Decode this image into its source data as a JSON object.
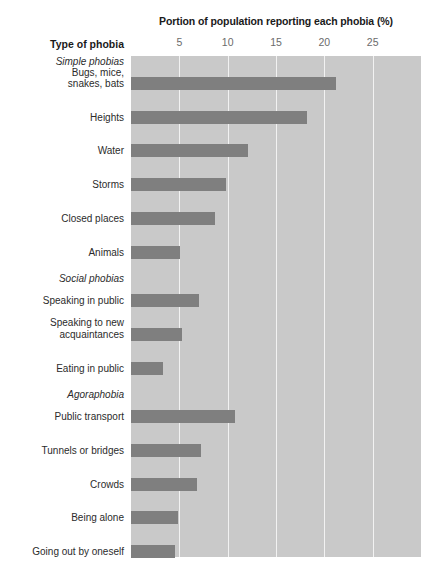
{
  "chart_data": {
    "type": "bar",
    "orientation": "horizontal",
    "title": "Portion of population reporting each phobia (%)",
    "category_axis_title": "Type of phobia",
    "xlabel": "Portion of population reporting each phobia (%)",
    "ylabel": "Type of phobia",
    "xlim": [
      0,
      30
    ],
    "xticks": [
      5,
      10,
      15,
      20,
      25
    ],
    "xtick_labels": [
      "5",
      "10",
      "15",
      "20",
      "25"
    ],
    "grid": "vertical",
    "legend": "none",
    "colors": {
      "bar": "#7f7f7f",
      "plot_background": "#c9c9c9",
      "gridline": "#f2f2f2",
      "page_background": "#ffffff",
      "tick_label": "#6b6b6b",
      "label_text": "#2b2b2b",
      "title_text": "#1a1a1a"
    },
    "groups": [
      {
        "name": "Simple phobias",
        "items": [
          {
            "label": "Bugs, mice, snakes, bats",
            "label_lines": [
              "Bugs, mice,",
              "snakes, bats"
            ],
            "value": 21.2
          },
          {
            "label": "Heights",
            "label_lines": [
              "Heights"
            ],
            "value": 18.2
          },
          {
            "label": "Water",
            "label_lines": [
              "Water"
            ],
            "value": 12.1
          },
          {
            "label": "Storms",
            "label_lines": [
              "Storms"
            ],
            "value": 9.8
          },
          {
            "label": "Closed places",
            "label_lines": [
              "Closed places"
            ],
            "value": 8.7
          },
          {
            "label": "Animals",
            "label_lines": [
              "Animals"
            ],
            "value": 5.1
          }
        ]
      },
      {
        "name": "Social phobias",
        "items": [
          {
            "label": "Speaking in public",
            "label_lines": [
              "Speaking in public"
            ],
            "value": 7.0
          },
          {
            "label": "Speaking to new acquaintances",
            "label_lines": [
              "Speaking to new",
              "acquaintances"
            ],
            "value": 5.3
          },
          {
            "label": "Eating in public",
            "label_lines": [
              "Eating in public"
            ],
            "value": 3.3
          }
        ]
      },
      {
        "name": "Agoraphobia",
        "items": [
          {
            "label": "Public transport",
            "label_lines": [
              "Public transport"
            ],
            "value": 10.8
          },
          {
            "label": "Tunnels or bridges",
            "label_lines": [
              "Tunnels or bridges"
            ],
            "value": 7.2
          },
          {
            "label": "Crowds",
            "label_lines": [
              "Crowds"
            ],
            "value": 6.8
          },
          {
            "label": "Being alone",
            "label_lines": [
              "Being alone"
            ],
            "value": 4.9
          },
          {
            "label": "Going out by oneself",
            "label_lines": [
              "Going out by oneself"
            ],
            "value": 4.6
          }
        ]
      }
    ]
  }
}
